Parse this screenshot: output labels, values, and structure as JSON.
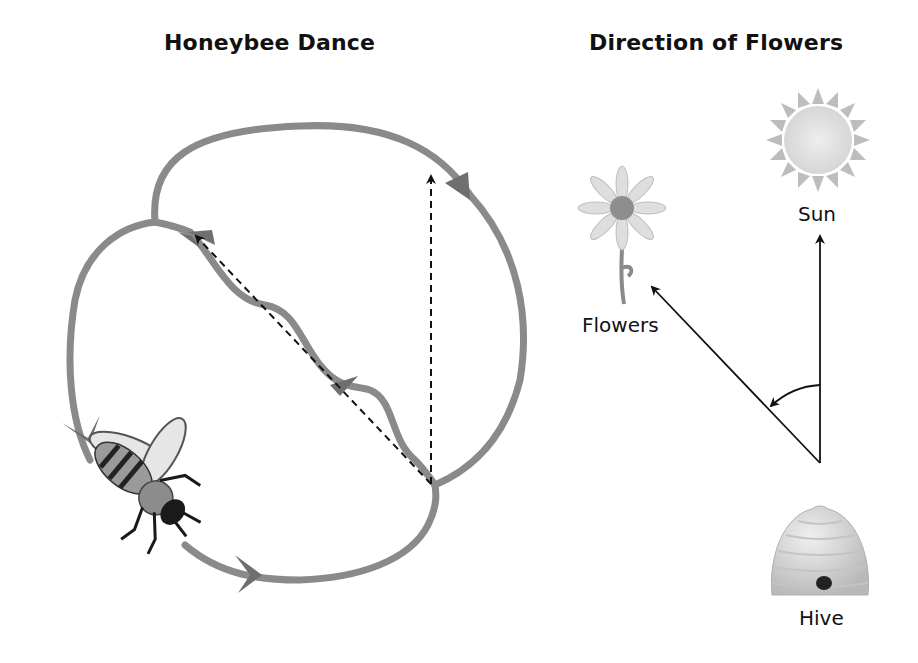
{
  "panels": {
    "dance": {
      "title": "Honeybee Dance"
    },
    "direction": {
      "title": "Direction of Flowers",
      "labels": {
        "sun": "Sun",
        "flowers": "Flowers",
        "hive": "Hive"
      }
    }
  },
  "colors": {
    "path": "#8a8a8a",
    "arrowhead": "#6f6f6f",
    "line": "#111111",
    "sun_fill": "#e3e3e3",
    "sun_rays": "#bdbdbd",
    "hive_fill": "#dcdcdc"
  }
}
